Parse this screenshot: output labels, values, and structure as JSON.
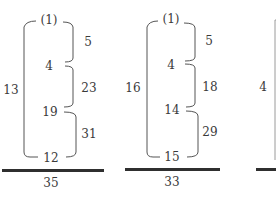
{
  "diagrams": [
    {
      "sequence": [
        "(1)",
        "4",
        "19",
        "12"
      ],
      "differences": [
        "5",
        "23",
        "31"
      ],
      "outer_label": "13",
      "sum": "35"
    },
    {
      "sequence": [
        "(1)",
        "4",
        "14",
        "15"
      ],
      "differences": [
        "5",
        "18",
        "29"
      ],
      "outer_label": "16",
      "sum": "33"
    },
    {
      "sequence": [],
      "differences": [],
      "outer_label": "4",
      "sum": ""
    }
  ],
  "colors": {
    "ink": "#3a3a3a",
    "bar": "#2f2f2f",
    "background": "#ffffff"
  }
}
